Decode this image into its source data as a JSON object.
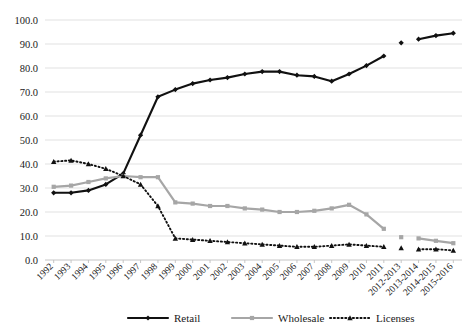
{
  "chart_data": {
    "type": "line",
    "title": "",
    "subtitle": "",
    "xlabel": "",
    "ylabel": "",
    "ylim": [
      0,
      100
    ],
    "ytick_labels": [
      "0.0",
      "10.0",
      "20.0",
      "30.0",
      "40.0",
      "50.0",
      "60.0",
      "70.0",
      "80.0",
      "90.0",
      "100.0"
    ],
    "ytick_values": [
      0,
      10,
      20,
      30,
      40,
      50,
      60,
      70,
      80,
      90,
      100
    ],
    "grid": true,
    "legend_position": "bottom",
    "categories": [
      "1992",
      "1993",
      "1994",
      "1995",
      "1996",
      "1997",
      "1998",
      "1999",
      "2000",
      "2001",
      "2002",
      "2003",
      "2004",
      "2005",
      "2006",
      "2007",
      "2008",
      "2009",
      "2010",
      "2011",
      "2012-2013",
      "2013-2014",
      "2014-2015",
      "2015-2016"
    ],
    "gap_after_category": "2011",
    "series": [
      {
        "name": "Retail",
        "color": "#111111",
        "style": "solid",
        "marker": "diamond",
        "values": [
          28.0,
          28.0,
          29.0,
          31.5,
          36.0,
          52.0,
          68.0,
          71.0,
          73.5,
          75.0,
          76.0,
          77.5,
          78.5,
          78.5,
          77.0,
          76.5,
          74.5,
          77.5,
          81.0,
          85.0,
          90.5,
          92.0,
          93.5,
          94.5
        ]
      },
      {
        "name": "Wholesale",
        "color": "#a6a6a6",
        "style": "solid",
        "marker": "square",
        "values": [
          30.5,
          31.0,
          32.5,
          34.0,
          35.0,
          34.5,
          34.5,
          24.0,
          23.5,
          22.5,
          22.5,
          21.5,
          21.0,
          20.0,
          20.0,
          20.5,
          21.5,
          23.0,
          19.0,
          13.0,
          9.5,
          9.0,
          8.0,
          7.0
        ]
      },
      {
        "name": "Licenses",
        "color": "#111111",
        "style": "dotted",
        "marker": "triangle",
        "values": [
          41.0,
          41.5,
          40.0,
          38.0,
          35.0,
          31.5,
          22.5,
          9.0,
          8.5,
          8.0,
          7.5,
          7.0,
          6.5,
          6.0,
          5.5,
          5.5,
          6.0,
          6.5,
          6.0,
          5.5,
          5.0,
          4.5,
          4.5,
          4.0
        ]
      }
    ]
  },
  "legend": {
    "items": [
      {
        "label": "Retail"
      },
      {
        "label": "Wholesale"
      },
      {
        "label": "Licenses"
      }
    ]
  }
}
